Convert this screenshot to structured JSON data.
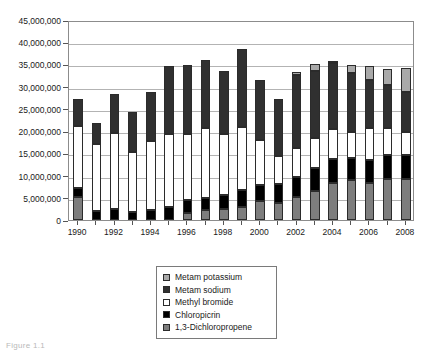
{
  "chart_data": {
    "type": "bar",
    "stacked": true,
    "title": "",
    "subtitle": "",
    "xlabel": "",
    "ylabel": "",
    "grid": true,
    "legend_position": "bottom-center",
    "ylim": [
      0,
      45000000
    ],
    "ytick_values": [
      0,
      5000000,
      10000000,
      15000000,
      20000000,
      25000000,
      30000000,
      35000000,
      40000000,
      45000000
    ],
    "ytick_labels": [
      "0",
      "5,000,000",
      "10,000,000",
      "15,000,000",
      "20,000,000",
      "25,000,000",
      "30,000,000",
      "35,000,000",
      "40,000,000",
      "45,000,000"
    ],
    "categories": [
      1990,
      1991,
      1992,
      1993,
      1994,
      1995,
      1996,
      1997,
      1998,
      1999,
      2000,
      2001,
      2002,
      2003,
      2004,
      2005,
      2006,
      2007,
      2008
    ],
    "xtick_labels": [
      "1990",
      "1992",
      "1994",
      "1996",
      "1998",
      "2000",
      "2002",
      "2004",
      "2006",
      "2008"
    ],
    "series": [
      {
        "name": "1,3-Dichloropropene",
        "color": "#7d7d7d",
        "values": [
          5200000,
          0,
          0,
          0,
          0,
          0,
          1500000,
          2200000,
          2500000,
          3000000,
          4200000,
          3800000,
          5100000,
          6600000,
          8400000,
          8900000,
          8300000,
          9200000,
          9200000
        ]
      },
      {
        "name": "Chloropicrin",
        "color": "#000000",
        "values": [
          2100000,
          2100000,
          2400000,
          1900000,
          2200000,
          2900000,
          3000000,
          2700000,
          3200000,
          3700000,
          3700000,
          4300000,
          4600000,
          5000000,
          5400000,
          5100000,
          5100000,
          5400000,
          5500000
        ]
      },
      {
        "name": "Methyl bromide",
        "color": "#ffffff",
        "values": [
          13900000,
          14900000,
          17200000,
          13500000,
          15500000,
          16500000,
          14900000,
          15900000,
          13700000,
          14300000,
          10100000,
          6200000,
          6600000,
          6800000,
          6600000,
          5900000,
          7400000,
          6100000,
          5000000
        ]
      },
      {
        "name": "Metam sodium",
        "color": "#303030",
        "values": [
          6100000,
          4900000,
          8800000,
          8800000,
          11200000,
          15200000,
          15400000,
          15200000,
          14100000,
          17500000,
          13400000,
          12900000,
          16300000,
          15100000,
          15000000,
          13100000,
          10800000,
          9600000,
          9100000
        ]
      },
      {
        "name": "Metam potassium",
        "color": "#a9a9a9",
        "values": [
          0,
          0,
          0,
          0,
          0,
          0,
          0,
          0,
          0,
          0,
          0,
          0,
          700000,
          1600000,
          400000,
          1800000,
          3100000,
          3700000,
          5500000
        ]
      }
    ],
    "totals": [
      27300000,
      21900000,
      28400000,
      24200000,
      28900000,
      34600000,
      34800000,
      36000000,
      33500000,
      38500000,
      31400000,
      27200000,
      33300000,
      35100000,
      35800000,
      34800000,
      34700000,
      34000000,
      34300000
    ]
  },
  "legend": {
    "items": [
      {
        "label": "Metam potassium",
        "swatch": "metam-potassium-swatch"
      },
      {
        "label": "Metam sodium",
        "swatch": "metam-sodium-swatch"
      },
      {
        "label": "Methyl bromide",
        "swatch": "methyl-bromide-swatch"
      },
      {
        "label": "Chloropicrin",
        "swatch": "chloropicrin-swatch"
      },
      {
        "label": "1,3-Dichloropropene",
        "swatch": "dichloropropene-swatch"
      }
    ]
  },
  "caption": {
    "text": "Figure 1.1"
  }
}
